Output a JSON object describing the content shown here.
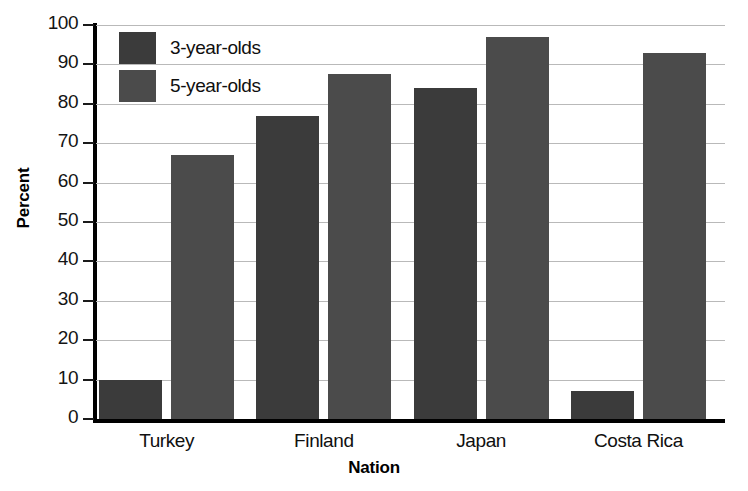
{
  "chart_data": {
    "type": "bar",
    "title": "",
    "xlabel": "Nation",
    "ylabel": "Percent",
    "categories": [
      "Turkey",
      "Finland",
      "Japan",
      "Costa Rica"
    ],
    "series": [
      {
        "name": "3-year-olds",
        "color": "#3b3b3b",
        "values": [
          10,
          77,
          84,
          7
        ]
      },
      {
        "name": "5-year-olds",
        "color": "#4b4b4b",
        "values": [
          67,
          87.5,
          97,
          93
        ]
      }
    ],
    "ylim": [
      0,
      100
    ],
    "yticks": [
      0,
      10,
      20,
      30,
      40,
      50,
      60,
      70,
      80,
      90,
      100
    ],
    "ytick_labels": [
      "0",
      "10",
      "20",
      "30",
      "40",
      "50",
      "60",
      "70",
      "80",
      "90",
      "100"
    ],
    "grid": true,
    "legend_position": "top-left-inside"
  }
}
